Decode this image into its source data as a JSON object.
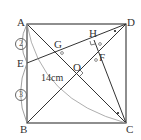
{
  "points": {
    "A": "A",
    "B": "B",
    "C": "C",
    "D": "D",
    "E": "E",
    "F": "F",
    "G": "G",
    "H": "H",
    "O": "O"
  },
  "length_label": "14cm",
  "ratio": {
    "top": "2",
    "bottom": "3"
  }
}
